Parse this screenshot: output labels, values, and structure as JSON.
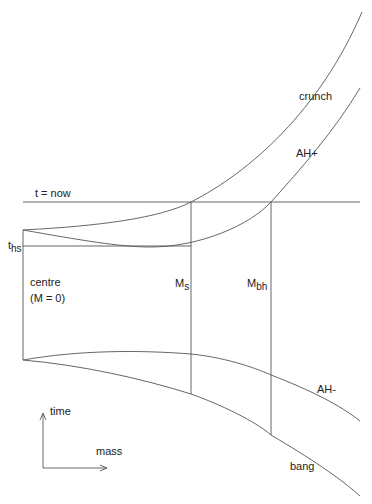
{
  "diagram": {
    "type": "spacetime-diagram",
    "labels": {
      "crunch": "crunch",
      "ah_plus": "AH+",
      "t_now": "t = now",
      "t_hs_main": "t",
      "t_hs_sub": "hs",
      "centre_line1": "centre",
      "centre_line2": "(M = 0)",
      "ms_main": "M",
      "ms_sub": "s",
      "mbh_main": "M",
      "mbh_sub": "bh",
      "ah_minus": "AH-",
      "bang": "bang",
      "axis_time": "time",
      "axis_mass": "mass"
    },
    "colors": {
      "stroke": "#555555",
      "text": "#222222",
      "background": "#ffffff"
    }
  }
}
